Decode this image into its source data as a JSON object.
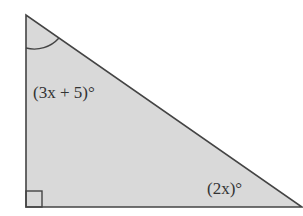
{
  "diagram": {
    "type": "right-triangle",
    "fill_color": "#d9d9d9",
    "stroke_color": "#444444",
    "labels": {
      "top_angle": "(3x + 5)°",
      "bottom_right_angle": "(2x)°"
    },
    "markers": {
      "right_angle": "bottom-left",
      "arc": "top vertex"
    }
  }
}
